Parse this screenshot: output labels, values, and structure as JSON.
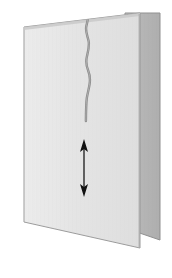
{
  "figure": {
    "canvas": {
      "width": 172,
      "height": 278,
      "background": "#ffffff"
    },
    "colors": {
      "back_panel_fill": "#b4b4b4",
      "back_panel_stroke": "#8f8f8f",
      "front_panel_fill": "#e3e3e3",
      "front_panel_fill_light": "#ececec",
      "front_panel_stroke": "#9a9a9a",
      "fold_edge": "#a8a8a8",
      "crack_stroke": "#8c8c8c",
      "arrow_stroke": "#1a1a1a",
      "arrow_fill": "#111111",
      "texture_line": "#d6d6d6"
    },
    "back_panel": {
      "label": "back-panel",
      "points": "125,13 160,13 160,240 125,228"
    },
    "front_panel": {
      "label": "front-panel",
      "points": "24,27 140,13 140,248 24,222"
    },
    "fold_line": {
      "label": "fold-edge",
      "x1": 140,
      "y1": 13,
      "x2": 140,
      "y2": 248
    },
    "crack": {
      "label": "crack",
      "start_x": 88,
      "start_y": 14,
      "end_x": 86,
      "end_y": 121,
      "path": "M 88.5 14 C 88.2 20 86.8 23 86.2 27 C 85.4 32 87.6 36 88.6 41 C 89.6 46 88.2 51 87.0 56 C 85.8 61 86.4 66 88.0 70 C 89.6 74 90.4 79 89.6 84 C 88.9 89 87.6 93 86.8 98 C 86.2 103 86.0 110 85.9 121"
    },
    "arrow": {
      "label": "double-headed-vertical-arrow",
      "x": 84,
      "top_y": 140,
      "bottom_y": 196,
      "shaft_x1": 84,
      "shaft_y1": 146,
      "shaft_x2": 84,
      "shaft_y2": 190,
      "head_top": "84,139 80,152 84,149 88,152",
      "head_bottom": "84,197 80,184 84,187 88,184",
      "stroke_width": 1.3
    }
  }
}
